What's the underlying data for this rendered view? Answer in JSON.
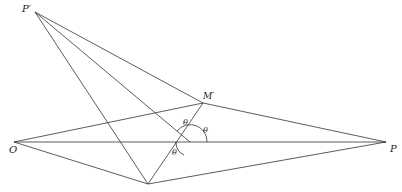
{
  "diagram": {
    "points": {
      "P_prime": {
        "label": "P′",
        "x": 35,
        "y": 12
      },
      "M_prime": {
        "label": "M′",
        "x": 203,
        "y": 103
      },
      "O": {
        "label": "O",
        "x": 14,
        "y": 142
      },
      "P": {
        "label": "P",
        "x": 386,
        "y": 142
      },
      "B": {
        "label": "",
        "x": 148,
        "y": 184
      },
      "X": {
        "label": "",
        "x": 190,
        "y": 142
      }
    },
    "angle_labels": [
      "θ",
      "θ",
      "θ"
    ],
    "stroke_color": "#333333"
  }
}
